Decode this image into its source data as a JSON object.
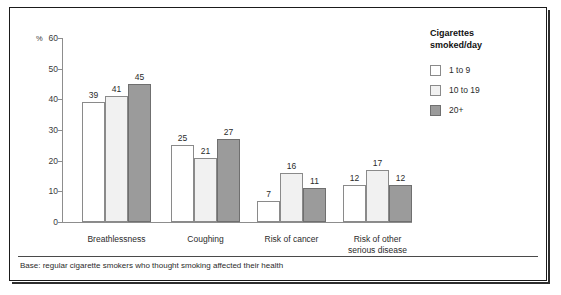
{
  "chart_data": {
    "type": "bar",
    "title": "",
    "subtitle": "",
    "xlabel": "",
    "ylabel": "%",
    "ylim": [
      0,
      60
    ],
    "yticks": [
      0,
      10,
      20,
      30,
      40,
      50,
      60
    ],
    "grid": false,
    "legend_position": "right",
    "legend_title": "Cigarettes\nsmoked/day",
    "categories": [
      "Breathlessness",
      "Coughing",
      "Risk of cancer",
      "Risk of other\nserious disease"
    ],
    "category_lines": [
      [
        "Breathlessness"
      ],
      [
        "Coughing"
      ],
      [
        "Risk of cancer"
      ],
      [
        "Risk of other",
        "serious disease"
      ]
    ],
    "series": [
      {
        "name": "1 to 9",
        "color": "#ffffff",
        "values": [
          39,
          25,
          7,
          12
        ]
      },
      {
        "name": "10 to 19",
        "color": "#f1f1f1",
        "values": [
          41,
          21,
          16,
          17
        ]
      },
      {
        "name": "20+",
        "color": "#9b9b9b",
        "values": [
          45,
          27,
          11,
          12
        ]
      }
    ],
    "footnote": "Base: regular cigarette smokers who thought smoking affected their health"
  }
}
